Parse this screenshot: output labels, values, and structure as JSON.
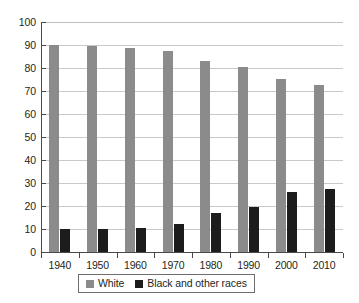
{
  "chart_data": {
    "type": "bar",
    "title": "",
    "subtitle": "",
    "xlabel": "",
    "ylabel": "",
    "categories": [
      "1940",
      "1950",
      "1960",
      "1970",
      "1980",
      "1990",
      "2000",
      "2010"
    ],
    "series": [
      {
        "name": "White",
        "color": "#8b8b8b",
        "values": [
          89.8,
          89.5,
          88.6,
          87.5,
          83.1,
          80.3,
          75.1,
          72.4
        ]
      },
      {
        "name": "Black and other races",
        "color": "#1c1c1c",
        "values": [
          9.8,
          10.0,
          10.3,
          12.2,
          16.9,
          19.7,
          25.9,
          27.6
        ]
      }
    ],
    "ylim": [
      0,
      100
    ],
    "ytick_values": [
      0,
      10,
      20,
      30,
      40,
      50,
      60,
      70,
      80,
      90,
      100
    ],
    "ytick_labels": [
      "0",
      "10",
      "20",
      "30",
      "40",
      "50",
      "60",
      "70",
      "80",
      "90",
      "100"
    ],
    "xtick_labels": [
      "1940",
      "1950",
      "1960",
      "1970",
      "1980",
      "1990",
      "2000",
      "2010"
    ],
    "grid": true,
    "grid_axis": "y",
    "legend_position": "bottom",
    "legend_entries": [
      "White",
      "Black and other races"
    ]
  },
  "axes": {
    "y_labels": [
      "100",
      "90",
      "80",
      "70",
      "60",
      "50",
      "40",
      "30",
      "20",
      "10",
      "0"
    ],
    "x_labels": [
      "1940",
      "1950",
      "1960",
      "1970",
      "1980",
      "1990",
      "2000",
      "2010"
    ]
  },
  "legend": {
    "items": [
      {
        "label": "White",
        "swatch": "gray-swatch"
      },
      {
        "label": "Black and other races",
        "swatch": "black-swatch"
      }
    ]
  },
  "colors": {
    "white_series": "#8b8b8b",
    "black_series": "#1c1c1c",
    "gridline": "#c9c9c9",
    "axis": "#4a4a4a",
    "text": "#231f20",
    "background": "#ffffff"
  }
}
